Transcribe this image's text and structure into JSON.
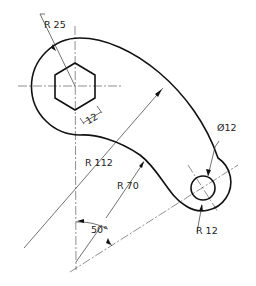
{
  "drawing": {
    "title": "Curved link / lever with hexagonal socket",
    "dimensions": {
      "boss_radius": "R 25",
      "hex_across_flats": "12",
      "hole_diameter": "Ø12",
      "outer_arc_radius": "R 112",
      "inner_arc_radius": "R 70",
      "end_radius": "R 12",
      "angle": "50°"
    },
    "colors": {
      "line": "#111111",
      "background": "#ffffff"
    }
  }
}
